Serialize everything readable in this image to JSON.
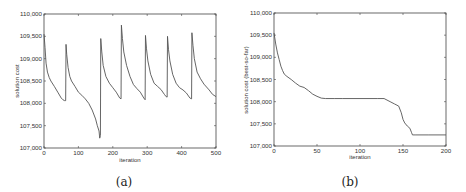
{
  "chart_data": [
    {
      "type": "line",
      "panel": "(a)",
      "title": "",
      "xlabel": "iteration",
      "ylabel": "solution cost",
      "xlim": [
        0,
        500
      ],
      "ylim": [
        107000,
        110000
      ],
      "xticks": [
        0,
        100,
        200,
        300,
        400,
        500
      ],
      "yticks": [
        107000,
        107500,
        108000,
        108500,
        109000,
        109500,
        110000
      ],
      "xtick_labels": [
        "0",
        "100",
        "200",
        "300",
        "400",
        "500"
      ],
      "ytick_labels": [
        "107,000",
        "107,500",
        "108,000",
        "108,500",
        "109,000",
        "109,500",
        "110,000"
      ],
      "grid": false,
      "legend": null,
      "series": [
        {
          "name": "solution cost",
          "x": [
            0,
            3,
            6,
            10,
            15,
            20,
            30,
            40,
            50,
            55,
            60,
            63,
            64,
            66,
            70,
            75,
            80,
            90,
            100,
            110,
            120,
            130,
            140,
            150,
            155,
            160,
            162,
            164,
            165,
            168,
            172,
            180,
            190,
            200,
            210,
            220,
            224,
            225,
            228,
            232,
            240,
            250,
            260,
            270,
            280,
            290,
            294,
            295,
            298,
            302,
            310,
            320,
            330,
            340,
            350,
            355,
            358,
            359,
            362,
            366,
            374,
            384,
            394,
            404,
            414,
            424,
            429,
            430,
            433,
            437,
            445,
            455,
            465,
            480,
            490,
            500
          ],
          "y": [
            109550,
            109250,
            108900,
            108700,
            108580,
            108500,
            108380,
            108250,
            108120,
            108080,
            108060,
            108060,
            109320,
            109100,
            108800,
            108600,
            108500,
            108380,
            108250,
            108180,
            108100,
            108000,
            107850,
            107650,
            107500,
            107380,
            107220,
            107280,
            109450,
            109150,
            108850,
            108600,
            108450,
            108350,
            108250,
            108120,
            108100,
            109750,
            109450,
            109150,
            108850,
            108600,
            108420,
            108330,
            108250,
            108120,
            108080,
            109520,
            109220,
            108950,
            108650,
            108450,
            108380,
            108310,
            108200,
            108150,
            108140,
            109500,
            109200,
            108950,
            108650,
            108450,
            108350,
            108300,
            108230,
            108120,
            108100,
            109580,
            109300,
            109000,
            108700,
            108550,
            108430,
            108300,
            108200,
            108150
          ]
        }
      ]
    },
    {
      "type": "line",
      "panel": "(b)",
      "title": "",
      "xlabel": "iteration",
      "ylabel": "solution cost (best-so-far)",
      "xlim": [
        0,
        200
      ],
      "ylim": [
        107000,
        110000
      ],
      "xticks": [
        0,
        50,
        100,
        150,
        200
      ],
      "yticks": [
        107000,
        107500,
        108000,
        108500,
        109000,
        109500,
        110000
      ],
      "xtick_labels": [
        "0",
        "50",
        "100",
        "150",
        "200"
      ],
      "ytick_labels": [
        "107,000",
        "107,500",
        "108,000",
        "108,500",
        "109,000",
        "109,500",
        "110,000"
      ],
      "grid": false,
      "legend": null,
      "series": [
        {
          "name": "best-so-far cost",
          "x": [
            0,
            2,
            4,
            6,
            8,
            10,
            12,
            15,
            20,
            25,
            30,
            35,
            40,
            45,
            50,
            55,
            60,
            70,
            80,
            100,
            120,
            128,
            135,
            140,
            145,
            148,
            150,
            152,
            155,
            158,
            160,
            161,
            165,
            180,
            200
          ],
          "y": [
            109550,
            109300,
            109100,
            108950,
            108800,
            108700,
            108620,
            108570,
            108500,
            108420,
            108350,
            108320,
            108250,
            108170,
            108120,
            108080,
            108070,
            108070,
            108070,
            108070,
            108070,
            108070,
            108000,
            107950,
            107900,
            107750,
            107600,
            107520,
            107450,
            107400,
            107300,
            107250,
            107250,
            107250,
            107250
          ]
        }
      ]
    }
  ],
  "captions": [
    "(a)",
    "(b)"
  ]
}
